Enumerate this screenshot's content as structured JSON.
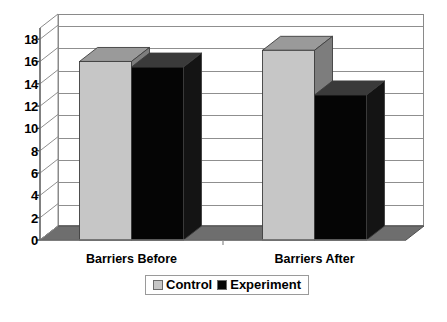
{
  "chart_data": {
    "type": "bar",
    "title": "",
    "subtitle": "",
    "xlabel": "",
    "ylabel": "",
    "categories": [
      "Barriers Before",
      "Barriers After"
    ],
    "series": [
      {
        "name": "Control",
        "values": [
          16,
          17
        ],
        "color": "#c6c6c6"
      },
      {
        "name": "Experiment",
        "values": [
          15.5,
          13
        ],
        "color": "#050505"
      }
    ],
    "ylim": [
      0,
      19
    ],
    "yticks": [
      0,
      2,
      4,
      6,
      8,
      10,
      12,
      14,
      16,
      18
    ],
    "ytick_labels": [
      "0",
      "2",
      "4",
      "6",
      "8",
      "10",
      "12",
      "14",
      "16",
      "18"
    ],
    "grid": true,
    "grid_axis": "y",
    "legend_position": "bottom",
    "three_d": true
  },
  "legend": {
    "entries": [
      {
        "label": "Control",
        "swatch_color": "#c6c6c6"
      },
      {
        "label": "Experiment",
        "swatch_color": "#050505"
      }
    ]
  },
  "colors": {
    "control_front": "#c6c6c6",
    "control_top": "#9a9a9a",
    "control_side": "#7d7d7d",
    "experiment_front": "#050505",
    "experiment_top": "#3a3a3a",
    "experiment_side": "#141414",
    "floor": "#6e6e6e",
    "wall": "#ffffff",
    "gridline": "#8f8f8f",
    "axis": "#8a8a8a",
    "text": "#000000"
  }
}
